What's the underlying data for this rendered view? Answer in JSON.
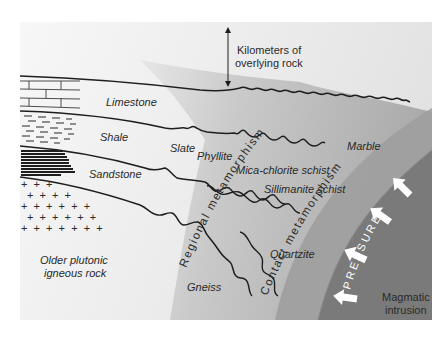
{
  "diagram": {
    "type": "geology-cross-section",
    "overburden_label_line1": "Kilometers of",
    "overburden_label_line2": "overlying rock",
    "sedimentary_layers": [
      {
        "name": "Limestone",
        "pattern": "brick"
      },
      {
        "name": "Shale",
        "pattern": "dashes"
      },
      {
        "name": "Sandstone",
        "pattern": "dots"
      }
    ],
    "igneous_basement": {
      "pattern": "crosses",
      "label_line1": "Older plutonic",
      "label_line2": "igneous rock"
    },
    "metamorphic_rocks": {
      "slate": "Slate",
      "phyllite": "Phyllite",
      "mica_chlorite_schist": "Mica-chlorite schist",
      "sillimanite_schist": "Sillimanite schist",
      "gneiss": "Gneiss",
      "marble": "Marble",
      "quartzite": "Quartzite"
    },
    "zones": {
      "regional": "Regional metamorphism",
      "contact": "Contact metamorphism"
    },
    "intrusion": {
      "label_line1": "Magmatic",
      "label_line2": "intrusion",
      "force_label": "PRESSURE",
      "arrow_count": 4
    },
    "colors": {
      "background": "#ffffff",
      "panel_light": "#f4f4f4",
      "regional_zone": "#b4b4b4",
      "contact_zone": "#9a9a9a",
      "intrusion": "#7c7c7c",
      "lines": "#1e1e1e",
      "arrows": "#ffffff"
    }
  }
}
